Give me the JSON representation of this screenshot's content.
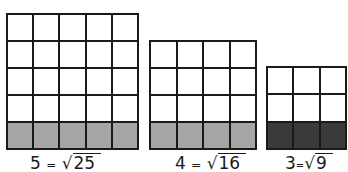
{
  "diagrams": [
    {
      "id": "five",
      "rows": 5,
      "cols": 5,
      "shaded_row": "bottom",
      "shade_color": "#a6a6a6",
      "label": {
        "lhs": "5",
        "eq": "=",
        "radical": "√",
        "radicand": "25"
      }
    },
    {
      "id": "four",
      "rows": 4,
      "cols": 4,
      "shaded_row": "bottom",
      "shade_color": "#a6a6a6",
      "label": {
        "lhs": "4",
        "eq": "=",
        "radical": "√",
        "radicand": "16"
      }
    },
    {
      "id": "three",
      "rows": 3,
      "cols": 3,
      "shaded_row": "bottom",
      "shade_color": "#3a3a3a",
      "label": {
        "lhs": "3",
        "eq": "=",
        "radical": "√",
        "radicand": "9"
      }
    }
  ]
}
